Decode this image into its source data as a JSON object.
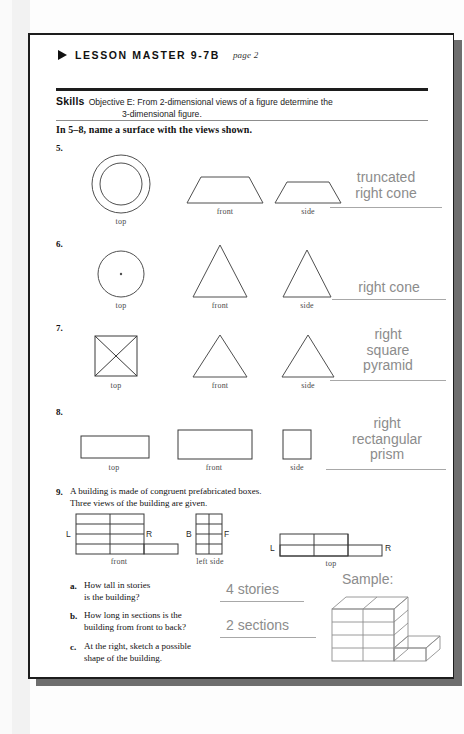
{
  "page": {
    "header_marker": "triangle-bullet",
    "lesson_master": "LESSON MASTER 9-7B",
    "page_note": "page 2"
  },
  "skills": {
    "label": "Skills",
    "objective_line1": "Objective E: From 2-dimensional views of a figure determine the",
    "objective_line2": "3-dimensional figure."
  },
  "instruction": "In 5–8, name a surface with the views shown.",
  "problems": [
    {
      "number": "5.",
      "views": [
        {
          "label": "top",
          "shape": "concentric-circles"
        },
        {
          "label": "front",
          "shape": "trapezoid"
        },
        {
          "label": "side",
          "shape": "trapezoid"
        }
      ],
      "answer_lines": [
        "truncated",
        "right cone"
      ]
    },
    {
      "number": "6.",
      "views": [
        {
          "label": "top",
          "shape": "circle-with-center-dot"
        },
        {
          "label": "front",
          "shape": "triangle"
        },
        {
          "label": "side",
          "shape": "triangle"
        }
      ],
      "answer_lines": [
        "right cone"
      ]
    },
    {
      "number": "7.",
      "views": [
        {
          "label": "top",
          "shape": "square-with-diagonals"
        },
        {
          "label": "front",
          "shape": "triangle"
        },
        {
          "label": "side",
          "shape": "triangle"
        }
      ],
      "answer_lines": [
        "right",
        "square",
        "pyramid"
      ]
    },
    {
      "number": "8.",
      "views": [
        {
          "label": "top",
          "shape": "rectangle-wide"
        },
        {
          "label": "front",
          "shape": "rectangle-wide"
        },
        {
          "label": "side",
          "shape": "rectangle-tall"
        }
      ],
      "answer_lines": [
        "right",
        "rectangular",
        "prism"
      ]
    }
  ],
  "problem9": {
    "number": "9.",
    "stem_line1": "A building is made of congruent prefabricated boxes.",
    "stem_line2": "Three views of the building are given.",
    "views": [
      {
        "label": "front",
        "left_marker": "L",
        "right_marker": "R"
      },
      {
        "label": "left side",
        "left_marker": "B",
        "right_marker": "F"
      },
      {
        "label": "top",
        "left_marker": "L",
        "right_marker": "R"
      }
    ],
    "parts": [
      {
        "letter": "a.",
        "question_line1": "How tall in stories",
        "question_line2": "is the building?",
        "answer": "4 stories"
      },
      {
        "letter": "b.",
        "question_line1": "How long in sections is the",
        "question_line2": "building from front to back?",
        "answer": "2 sections"
      },
      {
        "letter": "c.",
        "question_line1": "At the right, sketch a possible",
        "question_line2": "shape of the building.",
        "answer": ""
      }
    ],
    "sample_label": "Sample:"
  },
  "colors": {
    "ink": "#111111",
    "answer_gray": "#8c8c8c",
    "figure_stroke": "#4f4f4f",
    "rule_dark": "#1d1d1d",
    "rule_light": "#8d8d8d",
    "page_border": "#1d1d1d",
    "shadow": "#6e6e6e"
  }
}
